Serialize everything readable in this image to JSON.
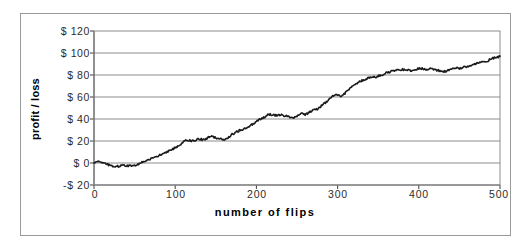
{
  "chart_data": {
    "type": "line",
    "title": "",
    "xlabel": "number of flips",
    "ylabel": "profit / loss",
    "xlim": [
      0,
      500
    ],
    "ylim": [
      -20,
      120
    ],
    "xticks": [
      0,
      100,
      200,
      300,
      400,
      500
    ],
    "yticks": [
      -20,
      0,
      20,
      40,
      60,
      80,
      100,
      120
    ],
    "xtick_labels": [
      "0",
      "100",
      "200",
      "300",
      "400",
      "500"
    ],
    "ytick_labels": [
      "-$20",
      "$0",
      "$20",
      "$40",
      "$60",
      "$80",
      "$100",
      "$120"
    ],
    "grid": "horizontal",
    "legend": "none",
    "series": [
      {
        "name": "cumulative profit / loss",
        "color": "#000000",
        "x": [
          0,
          5,
          10,
          15,
          20,
          25,
          30,
          35,
          40,
          45,
          50,
          55,
          60,
          65,
          70,
          75,
          80,
          85,
          90,
          95,
          100,
          105,
          110,
          115,
          120,
          125,
          130,
          135,
          140,
          145,
          150,
          155,
          160,
          165,
          170,
          175,
          180,
          185,
          190,
          195,
          200,
          205,
          210,
          215,
          220,
          225,
          230,
          235,
          240,
          245,
          250,
          255,
          260,
          265,
          270,
          275,
          280,
          285,
          290,
          295,
          300,
          305,
          310,
          315,
          320,
          325,
          330,
          335,
          340,
          345,
          350,
          355,
          360,
          365,
          370,
          375,
          380,
          385,
          390,
          395,
          400,
          405,
          410,
          415,
          420,
          425,
          430,
          435,
          440,
          445,
          450,
          455,
          460,
          465,
          470,
          475,
          480,
          485,
          490,
          495,
          500
        ],
        "y": [
          0,
          1,
          0,
          -1,
          -2,
          -3,
          -3,
          -2,
          -3,
          -2,
          -2,
          -1,
          1,
          2,
          4,
          5,
          7,
          9,
          10,
          12,
          14,
          16,
          19,
          21,
          20,
          21,
          22,
          21,
          23,
          24,
          23,
          22,
          21,
          23,
          26,
          28,
          30,
          31,
          33,
          35,
          38,
          40,
          42,
          44,
          44,
          43,
          44,
          43,
          42,
          41,
          43,
          45,
          44,
          46,
          48,
          49,
          52,
          55,
          58,
          61,
          62,
          61,
          64,
          68,
          71,
          73,
          75,
          76,
          78,
          78,
          79,
          80,
          82,
          83,
          84,
          84,
          85,
          85,
          84,
          85,
          86,
          86,
          85,
          86,
          85,
          84,
          83,
          84,
          85,
          86,
          86,
          87,
          88,
          89,
          90,
          91,
          92,
          93,
          95,
          96,
          97
        ]
      }
    ]
  },
  "axis": {
    "y_title": "profit / loss",
    "x_title": "number of flips",
    "y_labels": [
      "$ 120",
      "$ 100",
      "$ 80",
      "$ 60",
      "$ 40",
      "$ 20",
      "$ 0",
      "-$ 20"
    ],
    "x_labels": [
      "0",
      "100",
      "200",
      "300",
      "400",
      "500"
    ]
  },
  "style": {
    "line_color": "#1a1a1a",
    "grid_color": "#8c8c8c",
    "axis_color": "#4d4d4d",
    "frame_color": "#9a9a9a",
    "background": "#ffffff"
  }
}
